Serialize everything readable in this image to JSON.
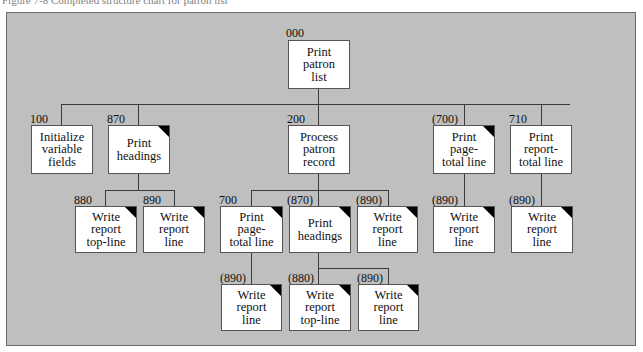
{
  "caption": "Figure 7-8   Completed structure chart for patron list",
  "colors": {
    "panel": "#bfbfbf",
    "box": "#ffffff",
    "line": "#3a3a3a",
    "corner_mark": "#000000"
  },
  "nodes": {
    "root": {
      "id": "000",
      "label": "Print patron list",
      "lines": [
        "Print",
        "patron",
        "list"
      ],
      "repeated": false
    },
    "n100": {
      "id": "100",
      "label": "Initialize variable fields",
      "lines": [
        "Initialize",
        "variable",
        "fields"
      ],
      "repeated": false
    },
    "n870": {
      "id": "870",
      "label": "Print headings",
      "lines": [
        "Print",
        "headings"
      ],
      "repeated": true
    },
    "n200": {
      "id": "200",
      "label": "Process patron record",
      "lines": [
        "Process",
        "patron",
        "record"
      ],
      "repeated": false
    },
    "n700r": {
      "id": "(700)",
      "label": "Print page-total line",
      "lines": [
        "Print",
        "page-",
        "total line"
      ],
      "repeated": true
    },
    "n710": {
      "id": "710",
      "label": "Print report-total line",
      "lines": [
        "Print",
        "report-",
        "total line"
      ],
      "repeated": false
    },
    "n880": {
      "id": "880",
      "label": "Write report top-line",
      "lines": [
        "Write",
        "report",
        "top-line"
      ],
      "repeated": true
    },
    "n890": {
      "id": "890",
      "label": "Write report line",
      "lines": [
        "Write",
        "report",
        "line"
      ],
      "repeated": true
    },
    "n700": {
      "id": "700",
      "label": "Print page-total line",
      "lines": [
        "Print",
        "page-",
        "total line"
      ],
      "repeated": true
    },
    "n870r": {
      "id": "(870)",
      "label": "Print headings",
      "lines": [
        "Print",
        "headings"
      ],
      "repeated": true
    },
    "n890r_a": {
      "id": "(890)",
      "label": "Write report line",
      "lines": [
        "Write",
        "report",
        "line"
      ],
      "repeated": true
    },
    "n890r_b": {
      "id": "(890)",
      "label": "Write report line",
      "lines": [
        "Write",
        "report",
        "line"
      ],
      "repeated": true
    },
    "n890r_c": {
      "id": "(890)",
      "label": "Write report line",
      "lines": [
        "Write",
        "report",
        "line"
      ],
      "repeated": true
    },
    "n890r_d": {
      "id": "(890)",
      "label": "Write report line",
      "lines": [
        "Write",
        "report",
        "line"
      ],
      "repeated": true
    },
    "n880r": {
      "id": "(880)",
      "label": "Write report top-line",
      "lines": [
        "Write",
        "report",
        "top-line"
      ],
      "repeated": true
    },
    "n890r_e": {
      "id": "(890)",
      "label": "Write report line",
      "lines": [
        "Write",
        "report",
        "line"
      ],
      "repeated": true
    }
  },
  "hierarchy": {
    "000": [
      "100",
      "870",
      "200",
      "(700)",
      "710"
    ],
    "870": [
      "880",
      "890"
    ],
    "200": [
      "700",
      "(870)",
      "(890)"
    ],
    "(700)": [
      "(890)"
    ],
    "710": [
      "(890)"
    ],
    "700": [
      "(890)"
    ],
    "(870)": [
      "(880)",
      "(890)"
    ]
  }
}
